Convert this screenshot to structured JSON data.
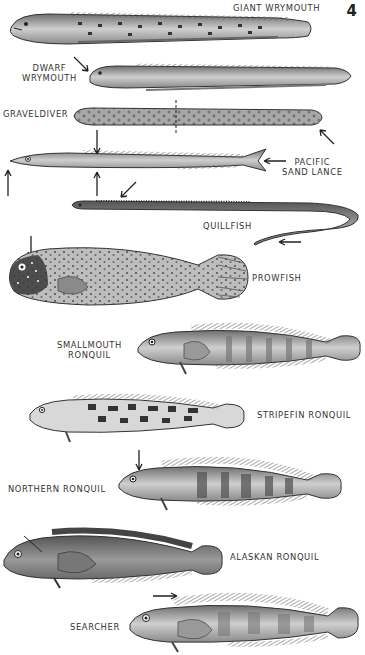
{
  "plate": {
    "number": "4"
  },
  "species": [
    {
      "id": "giant-wrymouth",
      "label": "GIANT WRYMOUTH"
    },
    {
      "id": "dwarf-wrymouth",
      "label_line1": "DWARF",
      "label_line2": "WRYMOUTH"
    },
    {
      "id": "graveldiver",
      "label": "GRAVELDIVER"
    },
    {
      "id": "pacific-sand-lance",
      "label_line1": "PACIFIC",
      "label_line2": "SAND LANCE"
    },
    {
      "id": "quillfish",
      "label": "QUILLFISH"
    },
    {
      "id": "prowfish",
      "label": "PROWFISH"
    },
    {
      "id": "smallmouth-ronquil",
      "label_line1": "SMALLMOUTH",
      "label_line2": "RONQUIL"
    },
    {
      "id": "stripefin-ronquil",
      "label": "STRIPEFIN RONQUIL"
    },
    {
      "id": "northern-ronquil",
      "label": "NORTHERN RONQUIL"
    },
    {
      "id": "alaskan-ronquil",
      "label": "ALASKAN RONQUIL"
    },
    {
      "id": "searcher",
      "label": "SEARCHER"
    }
  ],
  "colors": {
    "ink": "#222222",
    "body_light": "#cfcfcf",
    "body_mid": "#9a9a9a",
    "body_dark": "#5a5a5a",
    "background": "#ffffff"
  }
}
